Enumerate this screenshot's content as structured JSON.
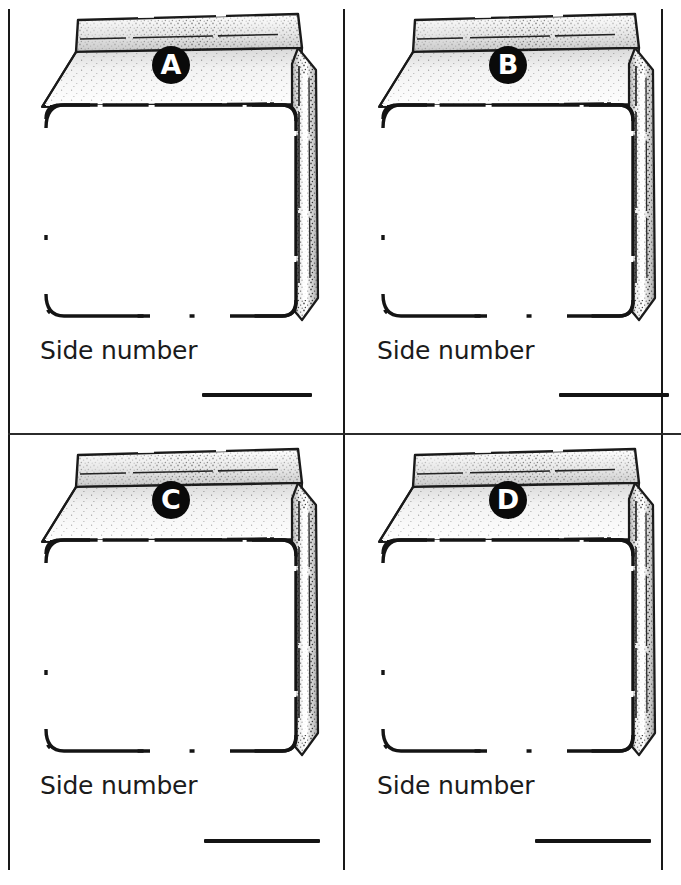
{
  "page": {
    "ink_color": "#141414",
    "paper_color": "#ffffff",
    "badge_fill": "#0a0a0a",
    "badge_text_color": "#ffffff"
  },
  "layout": {
    "columns": 2,
    "rows": 2,
    "frame": "rectangular border with one vertical and one horizontal divider"
  },
  "panels": [
    {
      "id": "a",
      "badge_letter": "A",
      "caption": "Side number",
      "answer_blank": "",
      "illustration": "gable-top-milk-carton"
    },
    {
      "id": "b",
      "badge_letter": "B",
      "caption": "Side number",
      "answer_blank": "",
      "illustration": "gable-top-milk-carton"
    },
    {
      "id": "c",
      "badge_letter": "C",
      "caption": "Side number",
      "answer_blank": "",
      "illustration": "gable-top-milk-carton"
    },
    {
      "id": "d",
      "badge_letter": "D",
      "caption": "Side number",
      "answer_blank": "",
      "illustration": "gable-top-milk-carton"
    }
  ]
}
